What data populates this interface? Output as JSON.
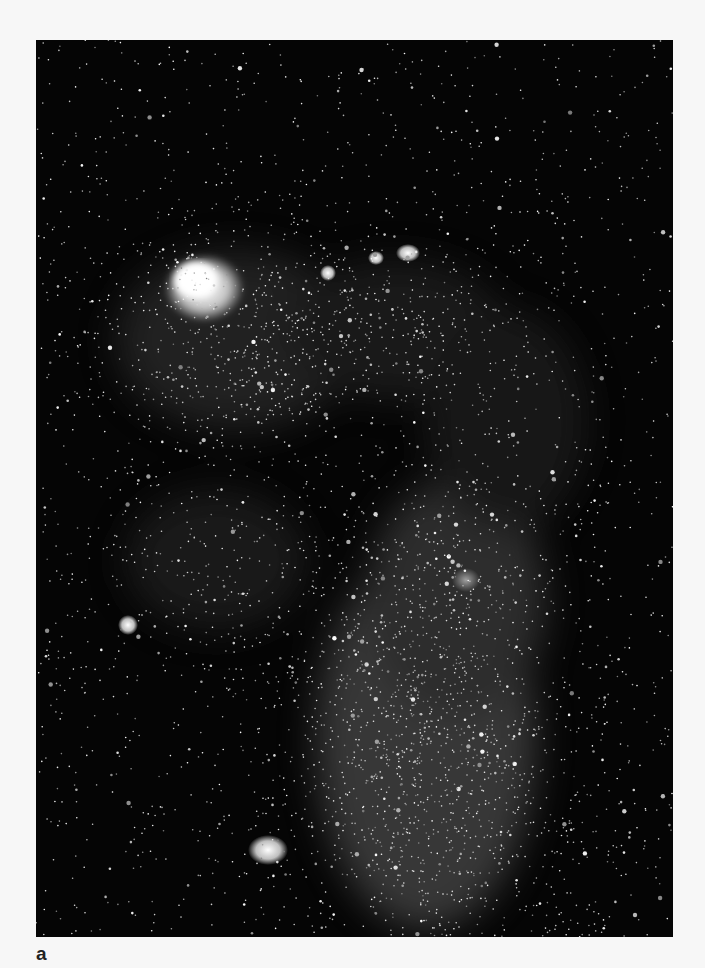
{
  "figure": {
    "panel_label": "a",
    "image": {
      "subject": "astronomical-photograph-galaxy-star-field",
      "background_color": "#050505",
      "star_color": "#ffffff",
      "page_background": "#f7f7f7"
    }
  }
}
